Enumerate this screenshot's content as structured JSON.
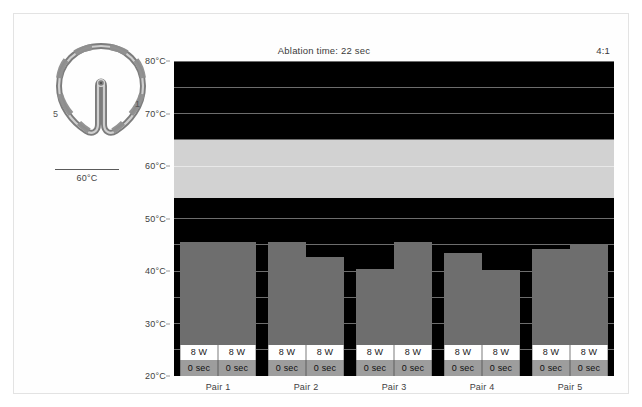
{
  "figure": {
    "title": "Ablation time: 22 sec",
    "ratio": "4:1"
  },
  "catheter": {
    "name": "circular-mapping-catheter-loop",
    "electrode_labels": [
      "5",
      "1"
    ]
  },
  "scale_legend": {
    "label": "60°C"
  },
  "axis": {
    "y_ticks": [
      "80°C",
      "70°C",
      "60°C",
      "50°C",
      "40°C",
      "30°C",
      "20°C"
    ],
    "x_ticks": [
      "Pair 1",
      "Pair 2",
      "Pair 3",
      "Pair 4",
      "Pair 5"
    ]
  },
  "labels": {
    "power": "8 W",
    "time": "0 sec"
  },
  "colors": {
    "plot_background": "#000000",
    "bar": "#6e6e6e",
    "band": "#d2d2d2",
    "gridline": "#6d6d6d",
    "power_label_bg": "#ffffff",
    "time_label_bg": "#9d9d9d"
  },
  "chart_data": {
    "type": "bar",
    "title": "Ablation time: 22 sec",
    "xlabel": "",
    "ylabel": "Temperature",
    "ylim": [
      20,
      80
    ],
    "ytick_values": [
      20,
      30,
      40,
      50,
      60,
      70,
      80
    ],
    "gridlines": [
      25,
      30,
      35,
      40,
      45,
      50,
      55,
      60,
      65,
      70,
      75,
      80
    ],
    "grid": true,
    "legend": "none",
    "target_band": {
      "label": "target temperature band",
      "min": 54,
      "max": 65,
      "mid": 60
    },
    "categories": [
      "Pair 1",
      "Pair 2",
      "Pair 3",
      "Pair 4",
      "Pair 5"
    ],
    "series": [
      {
        "name": "Electrode A",
        "values": [
          45.5,
          45.5,
          40.4,
          43.4,
          44.2
        ]
      },
      {
        "name": "Electrode B",
        "values": [
          45.5,
          42.7,
          45.5,
          40.2,
          45.1
        ]
      }
    ],
    "annotations": {
      "power_each_bar": "8 W",
      "time_each_bar": "0 sec",
      "ratio": "4:1"
    }
  }
}
